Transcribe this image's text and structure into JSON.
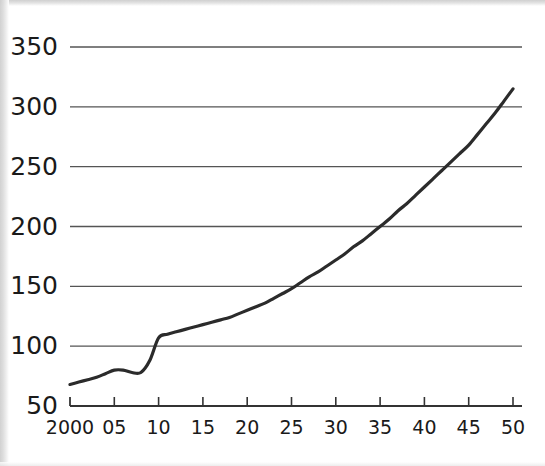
{
  "chart_data": {
    "type": "line",
    "title": "",
    "subtitle": "",
    "xlabel": "",
    "ylabel": "",
    "xlim": [
      2000,
      2050
    ],
    "ylim": [
      50,
      350
    ],
    "grid": "horizontal",
    "legend": "none",
    "line_color": "#2b2b2b",
    "gridline_color": "#555555",
    "axis_color": "#333333",
    "background_color": "#ffffff",
    "x_tick_labels": [
      "2000",
      "05",
      "10",
      "15",
      "20",
      "25",
      "30",
      "35",
      "40",
      "45",
      "50"
    ],
    "x_tick_values": [
      2000,
      2005,
      2010,
      2015,
      2020,
      2025,
      2030,
      2035,
      2040,
      2045,
      2050
    ],
    "y_tick_labels": [
      "50",
      "100",
      "150",
      "200",
      "250",
      "300",
      "350"
    ],
    "y_tick_values": [
      50,
      100,
      150,
      200,
      250,
      300,
      350
    ],
    "series": [
      {
        "name": "series-1",
        "x": [
          2000,
          2001,
          2002,
          2003,
          2004,
          2005,
          2006,
          2007,
          2008,
          2009,
          2010,
          2011,
          2012,
          2013,
          2014,
          2015,
          2016,
          2017,
          2018,
          2019,
          2020,
          2021,
          2022,
          2023,
          2024,
          2025,
          2026,
          2027,
          2028,
          2029,
          2030,
          2031,
          2032,
          2033,
          2034,
          2035,
          2036,
          2037,
          2038,
          2039,
          2040,
          2041,
          2042,
          2043,
          2044,
          2045,
          2046,
          2047,
          2048,
          2049,
          2050
        ],
        "values": [
          68,
          70,
          72,
          74,
          77,
          80,
          80,
          78,
          78,
          88,
          107,
          110,
          112,
          114,
          116,
          118,
          120,
          122,
          124,
          127,
          130,
          133,
          136,
          140,
          144,
          148,
          153,
          158,
          162,
          167,
          172,
          177,
          183,
          188,
          194,
          200,
          206,
          213,
          219,
          226,
          233,
          240,
          247,
          254,
          261,
          268,
          277,
          286,
          295,
          305,
          315
        ]
      }
    ]
  },
  "geometry": {
    "plot_left": 70,
    "plot_right": 513,
    "plot_top": 47,
    "plot_bottom": 406,
    "gridline_right": 522
  }
}
